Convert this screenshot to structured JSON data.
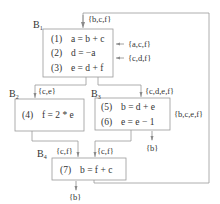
{
  "diagram": {
    "type": "control-flow-graph-liveness",
    "colors": {
      "stroke": "#9a9a9a",
      "text": "#333333",
      "background": "#ffffff"
    },
    "entry_set": "{b,c,f}",
    "blocks": [
      {
        "id": "B1",
        "label": "B",
        "sub": "1",
        "statements": [
          {
            "num": "(1)",
            "code": "a = b + c"
          },
          {
            "num": "(2)",
            "code": "d = −a"
          },
          {
            "num": "(3)",
            "code": "e = d + f"
          }
        ],
        "side_sets": [
          "{a,c,f}",
          "{c,d,f}"
        ]
      },
      {
        "id": "B2",
        "label": "B",
        "sub": "2",
        "in_set": "{c,e}",
        "statements": [
          {
            "num": "(4)",
            "code": "f = 2 * e"
          }
        ]
      },
      {
        "id": "B3",
        "label": "B",
        "sub": "3",
        "in_set": "{c,d,e,f}",
        "statements": [
          {
            "num": "(5)",
            "code": "b = d + e"
          },
          {
            "num": "(6)",
            "code": "e = e − 1"
          }
        ],
        "side_set": "{b,c,e,f}",
        "out_set": "{b}"
      },
      {
        "id": "B4",
        "label": "B",
        "sub": "4",
        "in_sets": [
          "{c,f}",
          "{c,f}"
        ],
        "statements": [
          {
            "num": "(7)",
            "code": "b = f + c"
          }
        ],
        "out_set": "{b}"
      }
    ]
  }
}
